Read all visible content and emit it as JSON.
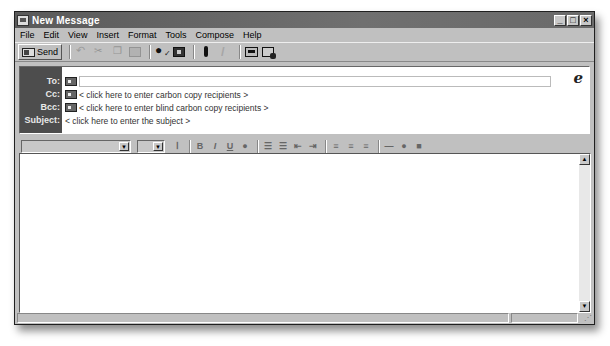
{
  "window": {
    "title": "New Message",
    "controls": {
      "minimize": "_",
      "maximize": "□",
      "close": "×"
    }
  },
  "menubar": {
    "items": [
      {
        "label": "File",
        "accel": "F"
      },
      {
        "label": "Edit",
        "accel": "E"
      },
      {
        "label": "View",
        "accel": "V"
      },
      {
        "label": "Insert",
        "accel": "I"
      },
      {
        "label": "Format",
        "accel": "o"
      },
      {
        "label": "Tools",
        "accel": "T"
      },
      {
        "label": "Compose",
        "accel": "C"
      },
      {
        "label": "Help",
        "accel": "H"
      }
    ]
  },
  "toolbar": {
    "send_label": "Send",
    "icons": [
      "send-icon",
      "undo-icon",
      "cut-icon",
      "copy-icon",
      "paste-icon",
      "check-names-icon",
      "address-book-icon",
      "attach-icon",
      "sign-icon",
      "encrypt-icon",
      "offline-icon"
    ]
  },
  "header": {
    "to_label": "To:",
    "cc_label": "Cc:",
    "bcc_label": "Bcc:",
    "subject_label": "Subject:",
    "to_value": "",
    "cc_placeholder": "< click here to enter carbon copy recipients >",
    "bcc_placeholder": "< click here to enter blind carbon copy recipients >",
    "subject_placeholder": "< click here to enter the subject >",
    "ie_icon": "e"
  },
  "format_toolbar": {
    "font_name": "",
    "font_size": "",
    "bold": "B",
    "italic": "I",
    "underline": "U"
  },
  "scrollbar": {
    "up": "▲",
    "down": "▼"
  },
  "status": {
    "grip": "⋰"
  }
}
